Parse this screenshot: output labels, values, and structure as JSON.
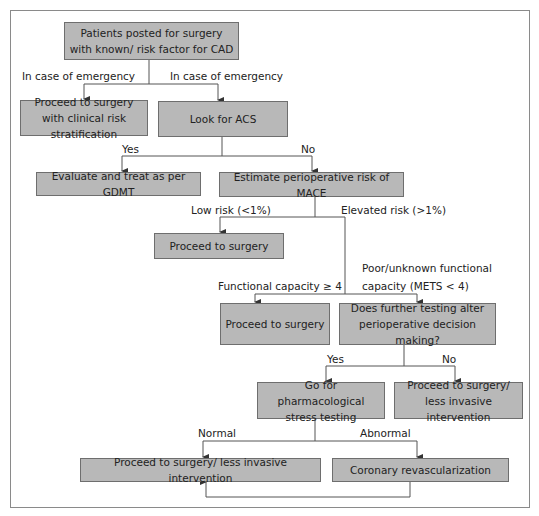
{
  "diagram": {
    "type": "flowchart",
    "colors": {
      "box_fill": "#b8b8b8",
      "box_border": "#6e6e6e",
      "line": "#555555",
      "frame": "#8a8a8a",
      "text": "#222222"
    },
    "nodes": {
      "start": "Patients posted for surgery with known/ risk factor for CAD",
      "emergency_proceed": "Proceed to surgery with clinical risk stratification",
      "look_acs": "Look for ACS",
      "evaluate_gdmt": "Evaluate and treat as per GDMT",
      "estimate_mace": "Estimate perioperative risk of MACE",
      "proceed_low": "Proceed to surgery",
      "proceed_functional": "Proceed to surgery",
      "further_testing": "Does further testing alter perioperative decision making?",
      "pharm_stress": "Go for pharmacological stress testing",
      "proceed_less_invasive_no": "Proceed to surgery/ less invasive intervention",
      "proceed_less_invasive_normal": "Proceed to surgery/ less invasive intervention",
      "coronary_revasc": "Coronary revascularization"
    },
    "edge_labels": {
      "emergency_left": "In case of emergency",
      "emergency_right": "In case of emergency",
      "acs_yes": "Yes",
      "acs_no": "No",
      "low_risk": "Low risk (<1%)",
      "elevated_risk": "Elevated risk (>1%)",
      "functional_good": "Functional capacity ≥ 4",
      "functional_poor_line1": "Poor/unknown functional",
      "functional_poor_line2": "capacity (METS < 4)",
      "testing_yes": "Yes",
      "testing_no": "No",
      "stress_normal": "Normal",
      "stress_abnormal": "Abnormal"
    },
    "edges": [
      {
        "from": "start",
        "to": "emergency_proceed",
        "label": "emergency_left"
      },
      {
        "from": "start",
        "to": "look_acs",
        "label": "emergency_right"
      },
      {
        "from": "look_acs",
        "to": "evaluate_gdmt",
        "label": "acs_yes"
      },
      {
        "from": "look_acs",
        "to": "estimate_mace",
        "label": "acs_no"
      },
      {
        "from": "estimate_mace",
        "to": "proceed_low",
        "label": "low_risk"
      },
      {
        "from": "estimate_mace",
        "to": "proceed_functional",
        "label": "functional_good"
      },
      {
        "from": "estimate_mace",
        "to": "further_testing",
        "label": "functional_poor"
      },
      {
        "from": "further_testing",
        "to": "pharm_stress",
        "label": "testing_yes"
      },
      {
        "from": "further_testing",
        "to": "proceed_less_invasive_no",
        "label": "testing_no"
      },
      {
        "from": "pharm_stress",
        "to": "proceed_less_invasive_normal",
        "label": "stress_normal"
      },
      {
        "from": "pharm_stress",
        "to": "coronary_revasc",
        "label": "stress_abnormal"
      },
      {
        "from": "coronary_revasc",
        "to": "proceed_less_invasive_normal",
        "label": ""
      }
    ]
  }
}
